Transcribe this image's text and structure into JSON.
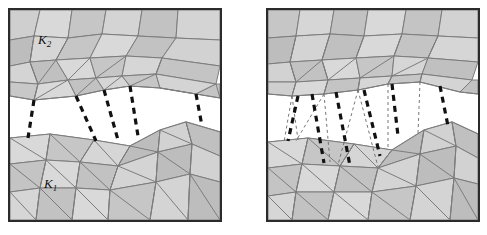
{
  "figure": {
    "type": "diagram",
    "panel_count": 2,
    "background_color": "#ffffff",
    "frame_color": "#2b2b2b",
    "mesh_edge_color": "#7c7c7c",
    "mesh_fill_light": "#d9d9d9",
    "mesh_fill_mid": "#cfcfcf",
    "mesh_fill_dark": "#bdbdbd",
    "mesh_fill_darker": "#b0b0b0",
    "dash_thick_color": "#111111",
    "dash_thin_color": "#555555"
  },
  "panels": [
    {
      "id": "left",
      "name": "panel-left",
      "labels": [
        {
          "id": "k2",
          "text": "K",
          "sub": "2",
          "x": 28,
          "y": 34
        },
        {
          "id": "k1",
          "text": "K",
          "sub": "1",
          "x": 38,
          "y": 178
        }
      ],
      "connectors_thick": 5,
      "connectors_thin": 0
    },
    {
      "id": "right",
      "name": "panel-right",
      "labels": [],
      "connectors_thick": 6,
      "connectors_thin": 8
    }
  ],
  "legend": {
    "upper_patch_label": "K2",
    "lower_patch_label": "K1"
  }
}
